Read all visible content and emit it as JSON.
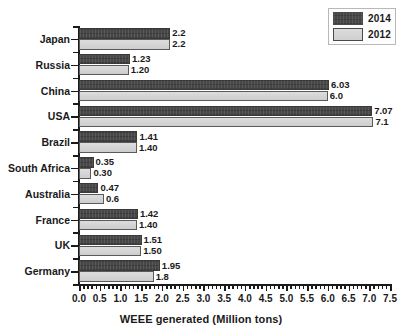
{
  "chart_data": {
    "type": "bar",
    "orientation": "horizontal",
    "title": "",
    "xlabel": "WEEE generated (Million tons)",
    "ylabel": "",
    "xlim": [
      0.0,
      7.5
    ],
    "xticks": [
      "0.0",
      "0.5",
      "1.0",
      "1.5",
      "2.0",
      "2.5",
      "3.0",
      "3.5",
      "4.0",
      "4.5",
      "5.0",
      "5.5",
      "6.0",
      "6.5",
      "7.0",
      "7.5"
    ],
    "xtick_step": 0.5,
    "minor_ticks": true,
    "grid": false,
    "legend_position": "top-right",
    "categories": [
      "Japan",
      "Russia",
      "China",
      "USA",
      "Brazil",
      "South Africa",
      "Australia",
      "France",
      "UK",
      "Germany"
    ],
    "series": [
      {
        "name": "2014",
        "color": "#474747",
        "values": [
          2.2,
          1.23,
          6.03,
          7.07,
          1.41,
          0.35,
          0.47,
          1.42,
          1.51,
          1.95
        ],
        "labels": [
          "2.2",
          "1.23",
          "6.03",
          "7.07",
          "1.41",
          "0.35",
          "0.47",
          "1.42",
          "1.51",
          "1.95"
        ]
      },
      {
        "name": "2012",
        "color": "#d2d2d2",
        "values": [
          2.2,
          1.2,
          6.0,
          7.1,
          1.4,
          0.3,
          0.6,
          1.4,
          1.5,
          1.8
        ],
        "labels": [
          "2.2",
          "1.20",
          "6.0",
          "7.1",
          "1.40",
          "0.30",
          "0.6",
          "1.40",
          "1.50",
          "1.8"
        ]
      }
    ]
  },
  "legend": {
    "items": [
      {
        "label": "2014",
        "swatch": "dark"
      },
      {
        "label": "2012",
        "swatch": "light"
      }
    ]
  },
  "axis": {
    "x_title": "WEEE generated (Million tons)"
  }
}
